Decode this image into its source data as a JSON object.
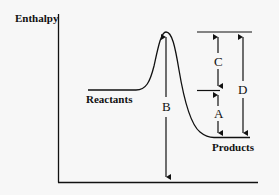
{
  "diagram": {
    "type": "energy-profile",
    "y_axis_label": "Enthalpy",
    "curve_labels": {
      "reactants": "Reactants",
      "products": "Products"
    },
    "arrows": [
      {
        "id": "A",
        "label": "A",
        "from": "products-level",
        "to": "reactants-level"
      },
      {
        "id": "B",
        "label": "B",
        "from": "baseline",
        "to": "transition-state"
      },
      {
        "id": "C",
        "label": "C",
        "from": "reactants-level",
        "to": "transition-state"
      },
      {
        "id": "D",
        "label": "D",
        "from": "products-level",
        "to": "transition-state"
      }
    ],
    "colors": {
      "line": "#111111",
      "background": "#f7f7f7"
    }
  }
}
